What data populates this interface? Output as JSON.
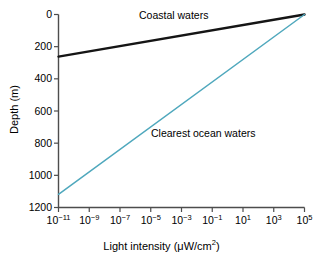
{
  "chart_data": {
    "type": "line",
    "title": "",
    "xlabel_text": "Light intensity (μW/cm",
    "xlabel_sup": "2",
    "xlabel_tail": ")",
    "xlabel_full": "Light intensity (μW/cm2)",
    "ylabel": "Depth (m)",
    "xscale": "log",
    "xlim": [
      1e-11,
      100000.0
    ],
    "ylim": [
      1200,
      0
    ],
    "y_inverted": true,
    "grid": false,
    "legend": "inline-annotations",
    "x_ticks": [
      {
        "value": 1e-11,
        "mantissa": "10",
        "exponent": "−11"
      },
      {
        "value": 1e-09,
        "mantissa": "10",
        "exponent": "−9"
      },
      {
        "value": 1e-07,
        "mantissa": "10",
        "exponent": "−7"
      },
      {
        "value": 1e-05,
        "mantissa": "10",
        "exponent": "−5"
      },
      {
        "value": 0.001,
        "mantissa": "10",
        "exponent": "−3"
      },
      {
        "value": 0.1,
        "mantissa": "10",
        "exponent": "−1"
      },
      {
        "value": 10.0,
        "mantissa": "10",
        "exponent": "1"
      },
      {
        "value": 1000.0,
        "mantissa": "10",
        "exponent": "3"
      },
      {
        "value": 100000.0,
        "mantissa": "10",
        "exponent": "5"
      }
    ],
    "y_ticks": [
      0,
      200,
      400,
      600,
      800,
      1000,
      1200
    ],
    "series": [
      {
        "name": "Coastal waters",
        "color": "#151515",
        "width": 2.4,
        "points": [
          {
            "x": 1e-11,
            "depth": 262
          },
          {
            "x": 100000.0,
            "depth": 0
          }
        ]
      },
      {
        "name": "Clearest ocean waters",
        "color": "#4fa8bd",
        "width": 1.5,
        "points": [
          {
            "x": 1e-11,
            "depth": 1118
          },
          {
            "x": 100000.0,
            "depth": 0
          }
        ]
      }
    ],
    "annotations": [
      {
        "text": "Coastal waters",
        "series": "Coastal waters"
      },
      {
        "text": "Clearest ocean waters",
        "series": "Clearest ocean waters"
      }
    ],
    "axis_color": "#4d4d4d"
  }
}
